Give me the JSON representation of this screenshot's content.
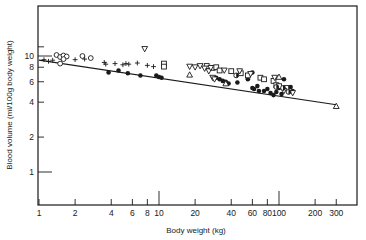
{
  "chart_data": {
    "type": "scatter",
    "title": "",
    "xlabel": "Body weight (kg)",
    "ylabel": "Blood volume (ml/100g body weight)",
    "xscale": "log",
    "yscale": "log",
    "xlim": [
      1,
      400
    ],
    "ylim": [
      0.7,
      30
    ],
    "grid": false,
    "legend": null,
    "x_ticks": [
      1,
      2,
      4,
      6,
      8,
      10,
      20,
      40,
      60,
      80,
      100,
      200,
      300
    ],
    "x_tick_labels": [
      "1",
      "2",
      "4",
      "6",
      "8",
      "10",
      "20",
      "40",
      "60",
      "80",
      "100",
      "200",
      "300"
    ],
    "y_ticks": [
      1,
      2,
      4,
      6,
      8,
      10
    ],
    "y_tick_labels": [
      "1",
      "2",
      "4",
      "6",
      "8",
      "10"
    ],
    "regression_line": {
      "x": [
        1,
        300
      ],
      "y": [
        9.2,
        3.8
      ]
    },
    "series": [
      {
        "name": "open-circle",
        "marker": "circle-open",
        "points": [
          [
            1.4,
            10.2
          ],
          [
            1.5,
            9.8
          ],
          [
            1.6,
            10.1
          ],
          [
            1.7,
            9.9
          ],
          [
            1.5,
            8.6
          ],
          [
            1.6,
            9.4
          ],
          [
            2.3,
            10.0
          ],
          [
            2.7,
            9.6
          ]
        ]
      },
      {
        "name": "plus",
        "marker": "plus",
        "points": [
          [
            1.1,
            9.3
          ],
          [
            1.2,
            9.0
          ],
          [
            1.3,
            9.2
          ],
          [
            2.0,
            9.3
          ],
          [
            3.5,
            8.8
          ],
          [
            3.6,
            8.5
          ],
          [
            4.3,
            8.6
          ],
          [
            5.0,
            8.4
          ],
          [
            5.3,
            8.6
          ],
          [
            5.6,
            8.5
          ],
          [
            6.6,
            8.7
          ],
          [
            8.0,
            8.3
          ],
          [
            9.0,
            8.1
          ],
          [
            2.4,
            9.4
          ]
        ]
      },
      {
        "name": "filled-circle",
        "marker": "circle-filled",
        "points": [
          [
            3.8,
            7.2
          ],
          [
            4.6,
            7.5
          ],
          [
            5.5,
            7.1
          ],
          [
            7.0,
            6.8
          ],
          [
            9.5,
            6.8
          ],
          [
            10.0,
            6.6
          ],
          [
            10.5,
            6.5
          ],
          [
            30,
            6.5
          ],
          [
            32,
            6.3
          ],
          [
            34,
            6.1
          ],
          [
            36,
            6.0
          ],
          [
            38,
            5.8
          ],
          [
            45,
            5.9
          ],
          [
            55,
            6.3
          ],
          [
            60,
            5.3
          ],
          [
            62,
            5.2
          ],
          [
            68,
            5.0
          ],
          [
            75,
            5.0
          ],
          [
            80,
            5.2
          ],
          [
            85,
            4.8
          ],
          [
            90,
            4.6
          ],
          [
            95,
            4.9
          ],
          [
            100,
            5.3
          ],
          [
            105,
            4.7
          ],
          [
            110,
            6.3
          ],
          [
            125,
            5.4
          ],
          [
            130,
            5.0
          ],
          [
            60,
            7.2
          ],
          [
            66,
            5.5
          ]
        ]
      },
      {
        "name": "open-square",
        "marker": "square-open",
        "points": [
          [
            11,
            8.6
          ],
          [
            11,
            8.1
          ],
          [
            25,
            8.2
          ],
          [
            28,
            7.9
          ],
          [
            30,
            8.0
          ],
          [
            32,
            7.5
          ],
          [
            40,
            7.4
          ],
          [
            48,
            7.1
          ],
          [
            55,
            6.8
          ],
          [
            70,
            6.5
          ],
          [
            75,
            6.3
          ],
          [
            90,
            6.1
          ],
          [
            95,
            5.6
          ],
          [
            100,
            5.5
          ],
          [
            115,
            5.3
          ]
        ]
      },
      {
        "name": "open-triangle-down",
        "marker": "triangle-down-open",
        "points": [
          [
            7.6,
            11.5
          ],
          [
            18,
            8.1
          ],
          [
            20,
            8.0
          ],
          [
            22,
            8.2
          ],
          [
            24,
            7.8
          ],
          [
            26,
            7.4
          ],
          [
            27,
            7.9
          ],
          [
            28,
            6.5
          ],
          [
            29,
            6.3
          ],
          [
            35,
            7.5
          ],
          [
            47,
            7.4
          ],
          [
            58,
            7.0
          ],
          [
            92,
            6.5
          ],
          [
            110,
            5.0
          ],
          [
            130,
            4.8
          ]
        ]
      },
      {
        "name": "open-triangle-up",
        "marker": "triangle-up-open",
        "points": [
          [
            18,
            6.9
          ],
          [
            36,
            5.8
          ],
          [
            100,
            6.6
          ],
          [
            300,
            3.7
          ]
        ]
      },
      {
        "name": "half-filled-circle",
        "marker": "circle-half",
        "points": [
          [
            44,
            6.8
          ],
          [
            95,
            5.4
          ],
          [
            120,
            4.9
          ],
          [
            108,
            5.3
          ]
        ]
      }
    ]
  }
}
